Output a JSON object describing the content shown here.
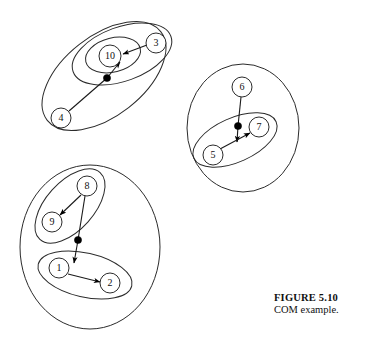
{
  "figure": {
    "caption_title": "FIGURE 5.10",
    "caption_text": "COM example.",
    "background_color": "#ffffff",
    "stroke_color": "#2b2b2b",
    "dot_color": "#000000"
  },
  "diagram_data": {
    "type": "diagram",
    "description": "COM example: three top-level clusters with nested sub-clusters, numbered nodes and directed edges meeting at junction dots",
    "clusters": [
      {
        "id": "cluster-top-left",
        "shape": "ellipse",
        "cx": 104,
        "cy": 76,
        "rx": 72,
        "ry": 40,
        "rotation": -38,
        "children": [
          "cluster-top-left-inner"
        ],
        "nodes": [
          "4"
        ]
      },
      {
        "id": "cluster-top-left-inner",
        "shape": "ellipse",
        "cx": 122,
        "cy": 54,
        "rx": 52,
        "ry": 27,
        "rotation": -20,
        "children": [
          "cluster-node10"
        ],
        "nodes": [
          "3"
        ]
      },
      {
        "id": "cluster-node10",
        "shape": "ellipse",
        "cx": 113,
        "cy": 55,
        "rx": 28,
        "ry": 17,
        "rotation": -14,
        "children": [],
        "nodes": [
          "10"
        ]
      },
      {
        "id": "cluster-middle",
        "shape": "circle",
        "cx": 243,
        "cy": 128,
        "rx": 56,
        "ry": 64,
        "rotation": 0,
        "children": [
          "cluster-middle-inner"
        ],
        "nodes": [
          "6"
        ]
      },
      {
        "id": "cluster-middle-inner",
        "shape": "ellipse",
        "cx": 235,
        "cy": 140,
        "rx": 45,
        "ry": 22,
        "rotation": -24,
        "children": [],
        "nodes": [
          "5",
          "7"
        ]
      },
      {
        "id": "cluster-bottom",
        "shape": "circle",
        "cx": 90,
        "cy": 247,
        "rx": 70,
        "ry": 82,
        "rotation": 0,
        "children": [
          "cluster-bottom-upper",
          "cluster-bottom-lower"
        ],
        "nodes": []
      },
      {
        "id": "cluster-bottom-upper",
        "shape": "ellipse",
        "cx": 70,
        "cy": 206,
        "rx": 45,
        "ry": 24,
        "rotation": -48,
        "children": [],
        "nodes": [
          "8",
          "9"
        ]
      },
      {
        "id": "cluster-bottom-lower",
        "shape": "ellipse",
        "cx": 85,
        "cy": 275,
        "rx": 48,
        "ry": 22,
        "rotation": 13,
        "children": [],
        "nodes": [
          "1",
          "2"
        ]
      }
    ],
    "nodes": [
      {
        "id": "1",
        "label": "1",
        "cx": 59,
        "cy": 268,
        "r": 10
      },
      {
        "id": "2",
        "label": "2",
        "cx": 110,
        "cy": 283,
        "r": 10
      },
      {
        "id": "3",
        "label": "3",
        "cx": 156,
        "cy": 43,
        "r": 10
      },
      {
        "id": "4",
        "label": "4",
        "cx": 61,
        "cy": 118,
        "r": 10
      },
      {
        "id": "5",
        "label": "5",
        "cx": 213,
        "cy": 155,
        "r": 10
      },
      {
        "id": "6",
        "label": "6",
        "cx": 242,
        "cy": 87,
        "r": 10
      },
      {
        "id": "7",
        "label": "7",
        "cx": 259,
        "cy": 127,
        "r": 10
      },
      {
        "id": "8",
        "label": "8",
        "cx": 87,
        "cy": 186,
        "r": 10
      },
      {
        "id": "9",
        "label": "9",
        "cx": 52,
        "cy": 222,
        "r": 10
      },
      {
        "id": "10",
        "label": "10",
        "cx": 110,
        "cy": 56,
        "r": 11
      }
    ],
    "junction_dots": [
      {
        "id": "dot-top-left",
        "cx": 107,
        "cy": 78,
        "r": 3.6
      },
      {
        "id": "dot-middle",
        "cx": 238,
        "cy": 126,
        "r": 3.6
      },
      {
        "id": "dot-bottom",
        "cx": 78,
        "cy": 240,
        "r": 3.6
      }
    ],
    "edges": [
      {
        "id": "edge-4-dot",
        "from": "4",
        "to": "dot-top-left",
        "arrow": false
      },
      {
        "id": "edge-dot-10",
        "from": "dot-top-left",
        "to": "10",
        "arrow": true
      },
      {
        "id": "edge-3-10",
        "from": "3",
        "to": "10",
        "arrow": true
      },
      {
        "id": "edge-6-dot",
        "from": "6",
        "to": "dot-middle",
        "arrow": false
      },
      {
        "id": "edge-dot-down",
        "from": "dot-middle",
        "to": "below-dot-middle",
        "arrow": true
      },
      {
        "id": "edge-5-7",
        "from": "5",
        "to": "7",
        "arrow": true
      },
      {
        "id": "edge-8-9",
        "from": "8",
        "to": "9",
        "arrow": true
      },
      {
        "id": "edge-8-dot",
        "from": "8",
        "to": "dot-bottom",
        "arrow": false
      },
      {
        "id": "edge-dot-down2",
        "from": "dot-bottom",
        "to": "below-dot-bottom",
        "arrow": true
      },
      {
        "id": "edge-1-2",
        "from": "1",
        "to": "2",
        "arrow": true
      }
    ]
  }
}
